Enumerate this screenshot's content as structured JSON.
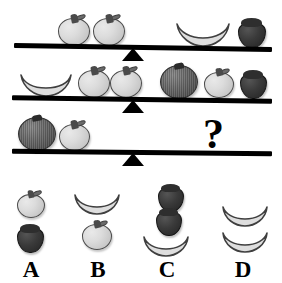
{
  "puzzle": {
    "title": "Balance scale fruit weight puzzle",
    "question_symbol": "?",
    "colors": {
      "background": "#ffffff",
      "beam": "#000000",
      "apple": "#dcdcdc",
      "banana": "#dcdcdc",
      "strawberry": "#2a2a2a",
      "grapefruit": "#6f6f6f",
      "label_text": "#000000"
    }
  },
  "scales": [
    {
      "index": 1,
      "name": "balance-row-1",
      "left_side": {
        "items": [
          {
            "fruit": "apple",
            "count": 1
          },
          {
            "fruit": "apple",
            "count": 1
          }
        ],
        "summary": "2 apples"
      },
      "right_side": {
        "items": [
          {
            "fruit": "banana",
            "count": 1
          },
          {
            "fruit": "strawberry",
            "count": 1
          }
        ],
        "summary": "1 banana + 1 strawberry"
      },
      "state": "balanced"
    },
    {
      "index": 2,
      "name": "balance-row-2",
      "left_side": {
        "items": [
          {
            "fruit": "banana",
            "count": 1
          },
          {
            "fruit": "apple",
            "count": 1
          },
          {
            "fruit": "apple",
            "count": 1
          }
        ],
        "summary": "1 banana + 2 apples"
      },
      "right_side": {
        "items": [
          {
            "fruit": "grapefruit",
            "count": 1
          },
          {
            "fruit": "apple",
            "count": 1
          },
          {
            "fruit": "strawberry",
            "count": 1
          }
        ],
        "summary": "1 grapefruit + 1 apple + 1 strawberry"
      },
      "state": "balanced"
    },
    {
      "index": 3,
      "name": "balance-row-3",
      "left_side": {
        "items": [
          {
            "fruit": "grapefruit",
            "count": 1
          },
          {
            "fruit": "apple",
            "count": 1
          }
        ],
        "summary": "1 grapefruit + 1 apple"
      },
      "right_side": {
        "items": [
          {
            "fruit": "question-mark",
            "count": 1
          }
        ],
        "summary": "unknown"
      },
      "state": "balanced"
    }
  ],
  "options": [
    {
      "label": "A",
      "name": "option-a",
      "items": [
        {
          "fruit": "apple",
          "count": 1
        },
        {
          "fruit": "strawberry",
          "count": 1
        }
      ],
      "summary": "1 apple + 1 strawberry"
    },
    {
      "label": "B",
      "name": "option-b",
      "items": [
        {
          "fruit": "banana",
          "count": 1
        },
        {
          "fruit": "apple",
          "count": 1
        }
      ],
      "summary": "1 banana + 1 apple"
    },
    {
      "label": "C",
      "name": "option-c",
      "items": [
        {
          "fruit": "strawberry",
          "count": 2
        },
        {
          "fruit": "banana",
          "count": 1
        }
      ],
      "summary": "2 strawberries + 1 banana"
    },
    {
      "label": "D",
      "name": "option-d",
      "items": [
        {
          "fruit": "banana",
          "count": 2
        }
      ],
      "summary": "2 bananas"
    }
  ]
}
